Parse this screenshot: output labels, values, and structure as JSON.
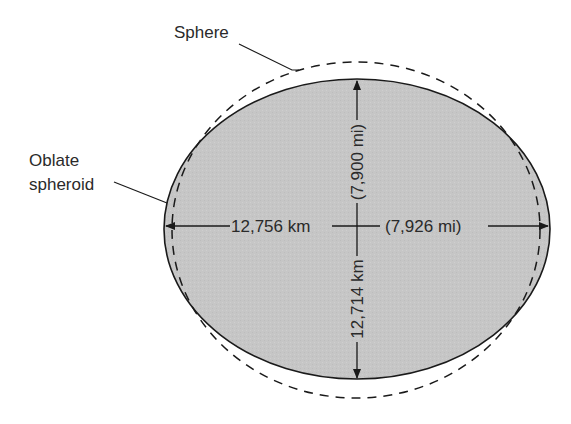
{
  "diagram": {
    "labels": {
      "sphere": "Sphere",
      "oblate_line1": "Oblate",
      "oblate_line2": "spheroid"
    },
    "equatorial": {
      "km": "12,756 km",
      "mi": "(7,926 mi)"
    },
    "polar": {
      "km": "12,714 km",
      "mi": "(7,900 mi)"
    },
    "colors": {
      "fill": "#c4c4c4",
      "stroke": "#1a1a1a",
      "text": "#2a2a2a"
    }
  }
}
